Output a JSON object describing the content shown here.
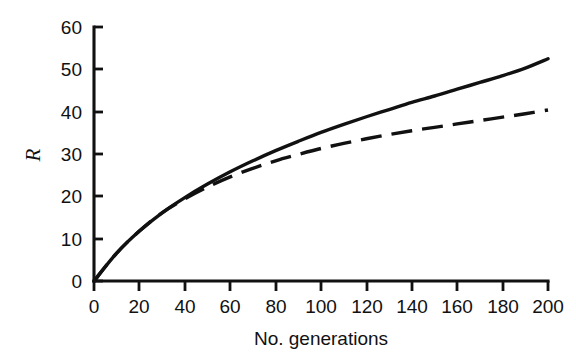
{
  "chart_data": {
    "type": "line",
    "title": "",
    "subtitle": "",
    "xlabel": "No. generations",
    "ylabel": "R",
    "xlim": [
      0,
      200
    ],
    "ylim": [
      0,
      60
    ],
    "xticks": [
      0,
      20,
      40,
      60,
      80,
      100,
      120,
      140,
      160,
      180,
      200
    ],
    "xtick_labels": [
      "0",
      "20",
      "40",
      "60",
      "80",
      "100",
      "120",
      "140",
      "160",
      "180",
      "200"
    ],
    "yticks": [
      0,
      10,
      20,
      30,
      40,
      50,
      60
    ],
    "ytick_labels": [
      "0",
      "10",
      "20",
      "30",
      "40",
      "50",
      "60"
    ],
    "grid": false,
    "legend": false,
    "legend_position": "none",
    "x": [
      0,
      10,
      20,
      30,
      40,
      50,
      60,
      70,
      80,
      90,
      100,
      110,
      120,
      130,
      140,
      150,
      160,
      170,
      180,
      190,
      200
    ],
    "series": [
      {
        "name": "solid",
        "style": "solid",
        "color": "#111111",
        "values": [
          0,
          6.6,
          11.8,
          16.1,
          19.7,
          22.9,
          25.8,
          28.4,
          30.8,
          33.0,
          35.1,
          37.0,
          38.8,
          40.5,
          42.2,
          43.7,
          45.3,
          46.9,
          48.5,
          50.3,
          52.5
        ]
      },
      {
        "name": "dashed",
        "style": "dashed",
        "color": "#111111",
        "values": [
          0,
          6.6,
          11.8,
          16.1,
          19.4,
          22.2,
          24.6,
          26.6,
          28.4,
          29.9,
          31.3,
          32.5,
          33.6,
          34.6,
          35.5,
          36.3,
          37.1,
          37.9,
          38.7,
          39.5,
          40.4
        ]
      }
    ],
    "annotations": []
  },
  "axes": {
    "y_axis_label": "R",
    "x_axis_label": "No. generations"
  }
}
